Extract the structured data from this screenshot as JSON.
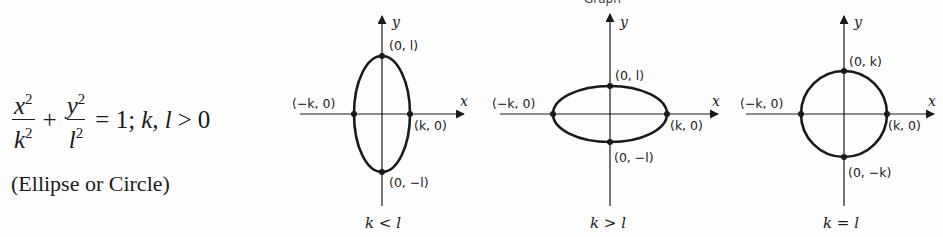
{
  "header": {
    "title": "Graph"
  },
  "equation": {
    "term1_num": "x",
    "term1_den": "k",
    "exp": "2",
    "term2_num": "y",
    "term2_den": "l",
    "plus": "+",
    "equals": "= 1;",
    "condition_vars": "k, l",
    "condition_op": ">",
    "condition_val": "0"
  },
  "description": "(Ellipse or Circle)",
  "graphs": [
    {
      "caption": "k < l",
      "x_axis_label": "x",
      "y_axis_label": "y",
      "points": {
        "top": "(0, l)",
        "bottom": "(0, −l)",
        "left": "(−k, 0)",
        "right": "(k, 0)"
      }
    },
    {
      "caption": "k > l",
      "x_axis_label": "x",
      "y_axis_label": "y",
      "points": {
        "top": "(0, l)",
        "bottom": "(0, −l)",
        "left": "(−k, 0)",
        "right": "(k, 0)"
      }
    },
    {
      "caption": "k = l",
      "x_axis_label": "x",
      "y_axis_label": "y",
      "points": {
        "top": "(0, k)",
        "bottom": "(0, −k)",
        "left": "(−k, 0)",
        "right": "(k, 0)"
      }
    }
  ],
  "colors": {
    "ink": "#1a1a1a",
    "background": "#fdfdfd"
  }
}
